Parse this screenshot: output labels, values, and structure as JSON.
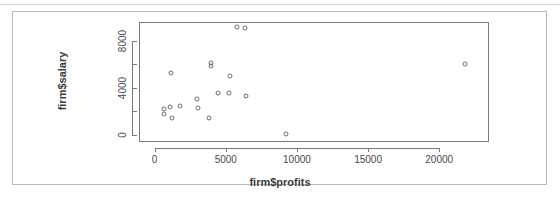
{
  "figure": {
    "background_color": "#ffffff",
    "frame_color": "#b9b9b9",
    "axis_color": "#7a7a7a",
    "point_color": "#6e6e6e"
  },
  "chart_data": {
    "type": "scatter",
    "title": "",
    "xlabel": "firm$profits",
    "ylabel": "firm$salary",
    "xlim": [
      -1100,
      23500
    ],
    "ylim": [
      -600,
      9600
    ],
    "grid": false,
    "legend": null,
    "x_ticks": [
      0,
      5000,
      10000,
      15000,
      20000
    ],
    "x_tick_labels": [
      "0",
      "5000",
      "10000",
      "15000",
      "20000"
    ],
    "x_minor_ticks": [
      2500,
      7500,
      12500,
      17500
    ],
    "y_ticks": [
      0,
      4000,
      8000
    ],
    "y_tick_labels": [
      "0",
      "4000",
      "8000"
    ],
    "y_minor_ticks": [
      2000,
      6000
    ],
    "marker": "open-circle",
    "points": [
      {
        "x": 5800,
        "y": 9150
      },
      {
        "x": 6350,
        "y": 9080
      },
      {
        "x": 3950,
        "y": 6100
      },
      {
        "x": 3950,
        "y": 5850
      },
      {
        "x": 21800,
        "y": 6000
      },
      {
        "x": 1150,
        "y": 5250
      },
      {
        "x": 5300,
        "y": 5000
      },
      {
        "x": 4450,
        "y": 3600
      },
      {
        "x": 5250,
        "y": 3550
      },
      {
        "x": 6400,
        "y": 3350
      },
      {
        "x": 3000,
        "y": 3050
      },
      {
        "x": 1800,
        "y": 2450
      },
      {
        "x": 1100,
        "y": 2350
      },
      {
        "x": 3050,
        "y": 2250
      },
      {
        "x": 650,
        "y": 2200
      },
      {
        "x": 650,
        "y": 1800
      },
      {
        "x": 1250,
        "y": 1450
      },
      {
        "x": 3800,
        "y": 1400
      },
      {
        "x": 9250,
        "y": 60
      }
    ]
  }
}
